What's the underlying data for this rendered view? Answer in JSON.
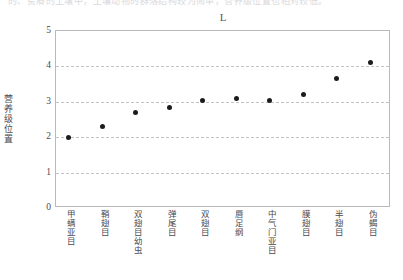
{
  "top_clipped_text": "的、贫瘠的土壤中，土壤动物的群落结构较为简单，营养级位置也相对较低。",
  "chart_data": {
    "type": "scatter",
    "title": "L",
    "xlabel": "",
    "ylabel": "营养级位置",
    "ylim": [
      0,
      5
    ],
    "yticks": [
      0,
      1,
      2,
      3,
      4,
      5
    ],
    "ytick_labels": [
      "0",
      "1",
      "2",
      "3",
      "4",
      "5"
    ],
    "gridlines": [
      1,
      2,
      3,
      4
    ],
    "grid": true,
    "legend": "none",
    "marker": "filled-circle",
    "marker_color": "#1c1c1c",
    "categories": [
      "甲螨亚目",
      "鞘翅目",
      "双翅目幼虫",
      "弹尾目",
      "双翅目",
      "唇足纲",
      "中气门亚目",
      "膜翅目",
      "半翅目",
      "伪蝎目"
    ],
    "values": [
      2.0,
      2.3,
      2.7,
      2.85,
      3.05,
      3.08,
      3.05,
      3.2,
      3.65,
      4.1
    ]
  }
}
